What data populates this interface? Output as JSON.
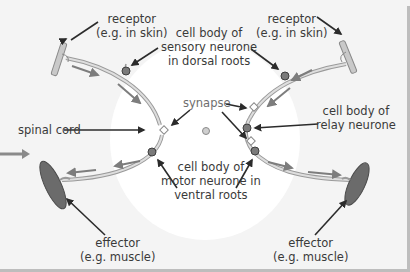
{
  "diagram": {
    "labels": {
      "receptor_left": [
        "receptor",
        "(e.g. in skin)"
      ],
      "receptor_right": [
        "receptor",
        "(e.g. in skin)"
      ],
      "sensory_cell_body": [
        "cell body of",
        "sensory neurone",
        "in dorsal roots"
      ],
      "synapse": "synapse",
      "spinal_cord": "spinal cord",
      "relay_cell_body": [
        "cell body of",
        "relay neurone"
      ],
      "motor_cell_body": [
        "cell body of",
        "motor neurone in",
        "ventral roots"
      ],
      "effector_left": [
        "effector",
        "(e.g. muscle)"
      ],
      "effector_right": [
        "effector",
        "(e.g. muscle)"
      ]
    },
    "colors": {
      "background": "#f4f4f4",
      "nerve": "#d3d3d3",
      "nerve_outline": "#9a9a9a",
      "cell_body": "#7a7a7a",
      "effector": "#6b6b6b",
      "impulse_arrow": "#7d7d7d",
      "label_arrow": "#2b2b2b",
      "text": "#3a3a3a"
    },
    "icons": {
      "incoming_arrow": "right-arrow-icon",
      "impulse_arrows": "direction-arrow-icon"
    }
  }
}
